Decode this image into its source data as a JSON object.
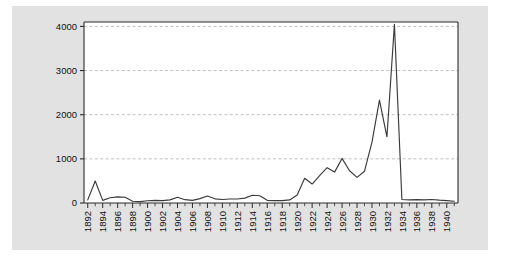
{
  "figure": {
    "background_color": "#ffffff",
    "panel_color": "#e2e2e2",
    "plot_background_color": "#ffffff",
    "axis_color": "#2b2b2b",
    "grid_color": "#b9b9b9",
    "line_color": "#3a3a3a"
  },
  "chart_data": {
    "type": "line",
    "title": "",
    "subtitle": "",
    "xlabel": "",
    "ylabel": "",
    "xlim": [
      1891.5,
      1941.5
    ],
    "ylim": [
      0,
      4100
    ],
    "yticks": [
      0,
      1000,
      2000,
      3000,
      4000
    ],
    "ytick_labels": [
      "0",
      "1000",
      "2000",
      "3000",
      "4000"
    ],
    "xtick_labels": [
      "1892",
      "1894",
      "1896",
      "1898",
      "1900",
      "1902",
      "1904",
      "1906",
      "1908",
      "1910",
      "1912",
      "1914",
      "1916",
      "1918",
      "1920",
      "1922",
      "1924",
      "1926",
      "1928",
      "1930",
      "1932",
      "1934",
      "1936",
      "1938",
      "1940"
    ],
    "xtick_label_rotation": 90,
    "xtick_interval_years": 2,
    "minor_tick_interval_years": 1,
    "grid": "horizontal-dashed",
    "legend": "none",
    "series": [
      {
        "name": "series-1",
        "x": [
          1892,
          1893,
          1894,
          1895,
          1896,
          1897,
          1898,
          1899,
          1900,
          1901,
          1902,
          1903,
          1904,
          1905,
          1906,
          1907,
          1908,
          1909,
          1910,
          1911,
          1912,
          1913,
          1914,
          1915,
          1916,
          1917,
          1918,
          1919,
          1920,
          1921,
          1922,
          1923,
          1924,
          1925,
          1926,
          1927,
          1928,
          1929,
          1930,
          1931,
          1932,
          1933,
          1934,
          1935,
          1936,
          1937,
          1938,
          1939,
          1940,
          1941
        ],
        "values": [
          70,
          500,
          60,
          120,
          140,
          130,
          40,
          30,
          50,
          60,
          55,
          70,
          130,
          75,
          60,
          100,
          160,
          95,
          80,
          90,
          90,
          110,
          175,
          165,
          60,
          55,
          55,
          70,
          180,
          560,
          430,
          620,
          800,
          700,
          1010,
          730,
          580,
          720,
          1380,
          2330,
          1500,
          4050,
          80,
          70,
          75,
          70,
          80,
          65,
          55,
          40
        ]
      }
    ]
  }
}
